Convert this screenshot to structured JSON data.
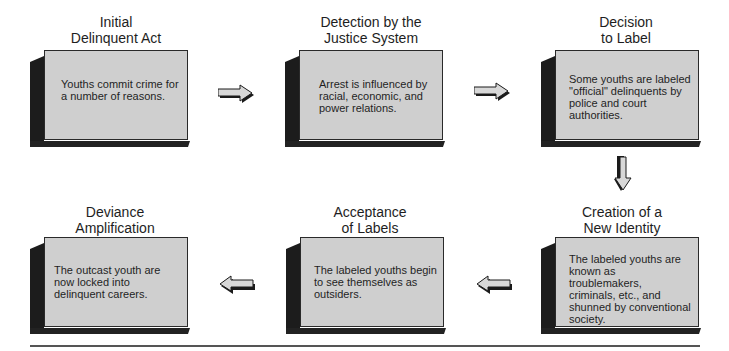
{
  "diagram": {
    "stages": [
      {
        "title_line1": "Initial",
        "title_line2": "Delinquent Act",
        "description": "Youths commit crime for a number of reasons."
      },
      {
        "title_line1": "Detection by the",
        "title_line2": "Justice System",
        "description": "Arrest is influenced by racial, economic, and power relations."
      },
      {
        "title_line1": "Decision",
        "title_line2": "to Label",
        "description": "Some youths are labeled \"official\" delinquents by police and court authorities."
      },
      {
        "title_line1": "Creation of a",
        "title_line2": "New Identity",
        "description": "The labeled youths are known as troublemakers, criminals, etc., and shunned by conventional society."
      },
      {
        "title_line1": "Acceptance",
        "title_line2": "of Labels",
        "description": "The labeled youths begin to see themselves as outsiders."
      },
      {
        "title_line1": "Deviance",
        "title_line2": "Amplification",
        "description": "The outcast youth are now locked into delinquent careers."
      }
    ],
    "arrows": [
      {
        "from": 1,
        "to": 2,
        "direction": "right"
      },
      {
        "from": 2,
        "to": 3,
        "direction": "right"
      },
      {
        "from": 3,
        "to": 4,
        "direction": "down"
      },
      {
        "from": 4,
        "to": 5,
        "direction": "left"
      },
      {
        "from": 5,
        "to": 6,
        "direction": "left"
      }
    ],
    "colors": {
      "box_face": "#cfcfcf",
      "box_side": "#1c1c1c",
      "arrow_fill": "#d8d8d8",
      "arrow_shadow": "#1a1a1a"
    }
  }
}
